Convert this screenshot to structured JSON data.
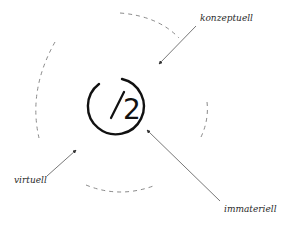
{
  "diagram": {
    "logo": {
      "slash": "/",
      "digit": "2",
      "color": "#111111"
    },
    "labels": {
      "top_right": "konzeptuell",
      "bottom_left": "virtuell",
      "bottom_right": "immateriell"
    },
    "colors": {
      "dash_arc": "#8a8a8a",
      "arrow": "#555555",
      "label": "#2a2a2a",
      "background": "#ffffff"
    }
  }
}
